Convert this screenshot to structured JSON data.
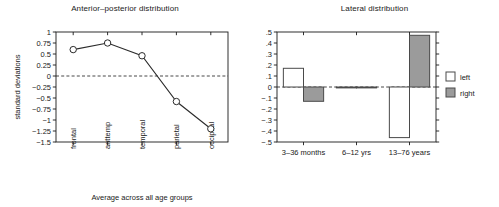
{
  "figure": {
    "colors": {
      "axis": "#1a1a1a",
      "line": "#2b2b2b",
      "marker_fill": "#ffffff",
      "bar_left_fill": "#ffffff",
      "bar_right_fill": "#9b9b9b",
      "bar_stroke": "#4a4a4a",
      "background": "#ffffff"
    }
  },
  "chart_data": [
    {
      "type": "line",
      "title": "Anterior–posterior distribution",
      "xlabel": "Average across all age groups",
      "ylabel": "standard deviations",
      "categories": [
        "frontal",
        "anttemp",
        "temporal",
        "parietal",
        "occipital"
      ],
      "values": [
        0.6,
        0.75,
        0.46,
        -0.58,
        -1.2
      ],
      "ylim": [
        -1.5,
        1
      ],
      "yticks": [
        1,
        0.75,
        0.5,
        0.25,
        0,
        -0.25,
        -0.5,
        -0.75,
        -1,
        -1.25,
        -1.5
      ],
      "ytick_labels": [
        "1",
        "0.75",
        "0.5",
        "0.25",
        "0",
        "−0.25",
        "−0.5",
        "−0.75",
        "−1",
        "−1.25",
        "−1.5"
      ],
      "zero_reference_line": 0,
      "grid": false,
      "marker": "open-circle",
      "legend": null
    },
    {
      "type": "bar",
      "title": "Lateral distribution",
      "xlabel": "",
      "ylabel": "",
      "categories": [
        "3–36 months",
        "6–12 yrs",
        "13–76 years"
      ],
      "series": [
        {
          "name": "left",
          "values": [
            0.17,
            0.0,
            -0.46
          ],
          "color": "#ffffff"
        },
        {
          "name": "right",
          "values": [
            -0.13,
            0.0,
            0.47
          ],
          "color": "#9b9b9b"
        }
      ],
      "ylim": [
        -0.5,
        0.5
      ],
      "yticks": [
        0.5,
        0.4,
        0.3,
        0.2,
        0.1,
        0,
        -0.1,
        -0.2,
        -0.3,
        -0.4,
        -0.5
      ],
      "ytick_labels": [
        ".5",
        ".4",
        ".3",
        ".2",
        ".1",
        "0",
        "−.1",
        "−.2",
        "−.3",
        "−.4",
        "−.5"
      ],
      "zero_reference_line": 0,
      "grid": false,
      "legend": {
        "position": "right",
        "entries": [
          "left",
          "right"
        ]
      }
    }
  ]
}
